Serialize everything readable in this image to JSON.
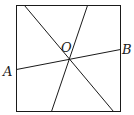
{
  "diagram": {
    "type": "geometry",
    "shape": "square",
    "square": {
      "x1": 16,
      "y1": 5,
      "x2": 120,
      "y2": 111
    },
    "lines": [
      {
        "name": "diagonal-line",
        "x1": 24,
        "y1": 5,
        "x2": 113,
        "y2": 111
      },
      {
        "name": "steep-line",
        "x1": 87,
        "y1": 5,
        "x2": 51,
        "y2": 111
      },
      {
        "name": "line-ab",
        "x1": 16,
        "y1": 69,
        "x2": 120,
        "y2": 49
      }
    ],
    "labels": {
      "O": {
        "text": "O",
        "x": 61,
        "y": 52
      },
      "A": {
        "text": "A",
        "x": 3,
        "y": 76
      },
      "B": {
        "text": "B",
        "x": 122,
        "y": 54
      }
    },
    "stroke_color": "#1a1a1a"
  }
}
